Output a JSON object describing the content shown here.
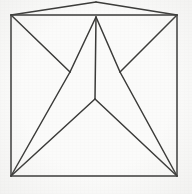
{
  "figure": {
    "type": "line-drawing",
    "background_color": "#fbfbfa",
    "stroke_color": "#3a3a38",
    "stroke_width": 1.5,
    "canvas": {
      "width": 192,
      "height": 194
    },
    "vertices": {
      "cap_apex": {
        "label": "cap apex",
        "x": 96,
        "y": 2
      },
      "top_left": {
        "label": "top left corner",
        "x": 11,
        "y": 15
      },
      "top_right": {
        "label": "top right corner",
        "x": 177,
        "y": 15
      },
      "inner_apex": {
        "label": "inner apex",
        "x": 96,
        "y": 17
      },
      "mid_left": {
        "label": "left mid vertex",
        "x": 70,
        "y": 72
      },
      "mid_right": {
        "label": "right mid vertex",
        "x": 120,
        "y": 72
      },
      "y_junction": {
        "label": "center Y junction",
        "x": 95,
        "y": 99
      },
      "bottom_left": {
        "label": "bottom left corner",
        "x": 11,
        "y": 176
      },
      "bottom_right": {
        "label": "bottom right corner",
        "x": 177,
        "y": 176
      }
    },
    "segments": [
      {
        "name": "cap-left-edge",
        "d": "M 96 2 L 11 15"
      },
      {
        "name": "cap-right-edge",
        "d": "M 96 2 L 177 15"
      },
      {
        "name": "square-top-edge",
        "d": "M 11 15 L 177 15"
      },
      {
        "name": "square-left-edge",
        "d": "M 11 15 L 11 176"
      },
      {
        "name": "square-right-edge",
        "d": "M 177 15 L 177 176"
      },
      {
        "name": "square-bottom-edge",
        "d": "M 11 176 L 177 176"
      },
      {
        "name": "apex-to-mid-left",
        "d": "M 96 17 L 70 72"
      },
      {
        "name": "apex-to-mid-right",
        "d": "M 96 17 L 120 72"
      },
      {
        "name": "apex-center-stem",
        "d": "M 96 17 L 95 99"
      },
      {
        "name": "topleft-to-mid-left",
        "d": "M 11 15 L 70 72"
      },
      {
        "name": "topright-to-mid-right",
        "d": "M 177 15 L 120 72"
      },
      {
        "name": "mid-left-to-bottom-left",
        "d": "M 70 72 L 11 176"
      },
      {
        "name": "mid-right-to-bottom-right",
        "d": "M 120 72 L 177 176"
      },
      {
        "name": "y-junction-to-bottom-left",
        "d": "M 95 99 L 11 176"
      },
      {
        "name": "y-junction-to-bottom-right",
        "d": "M 95 99 L 177 176"
      }
    ]
  }
}
